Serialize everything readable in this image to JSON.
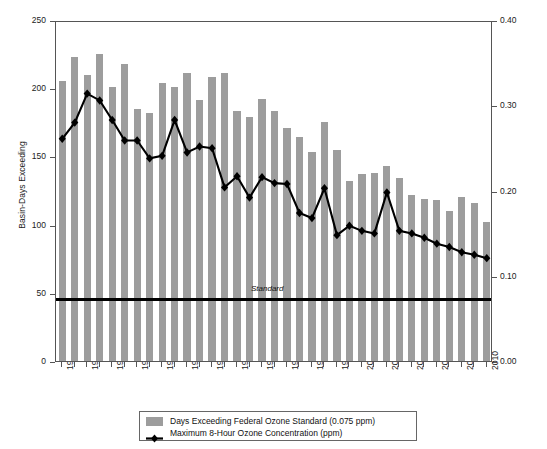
{
  "chart_data": {
    "type": "bar",
    "title": "",
    "xlabel": "",
    "ylabel": "Basin-Days Exceeding",
    "y2label": "Maximum Concentration, ppm",
    "ylim": [
      0,
      250
    ],
    "y2lim": [
      0.0,
      0.4
    ],
    "yticks": [
      0,
      50,
      100,
      150,
      200,
      250
    ],
    "ytick_labels": [
      "0",
      "50",
      "100",
      "150",
      "200",
      "250"
    ],
    "y2ticks": [
      0.0,
      0.1,
      0.2,
      0.3,
      0.4
    ],
    "y2tick_labels": [
      "0.00",
      "0.10",
      "0.20",
      "0.30",
      "0.40"
    ],
    "grid": false,
    "legend_position": "bottom-center",
    "x": [
      1976,
      1977,
      1978,
      1979,
      1980,
      1981,
      1982,
      1983,
      1984,
      1985,
      1986,
      1987,
      1988,
      1989,
      1990,
      1991,
      1992,
      1993,
      1994,
      1995,
      1996,
      1997,
      1998,
      1999,
      2000,
      2001,
      2002,
      2003,
      2004,
      2005,
      2006,
      2007,
      2008,
      2009,
      2010
    ],
    "xtick_labels": [
      "1976",
      "1978",
      "1980",
      "1982",
      "1984",
      "1986",
      "1988",
      "1990",
      "1992",
      "1994",
      "1996",
      "1998",
      "2000",
      "2002",
      "2004",
      "2006",
      "2008",
      "2010"
    ],
    "series": [
      {
        "name": "Days Exceeding Federal Ozone Standard (0.075 ppm)",
        "type": "bar",
        "axis": "left",
        "color": "#9d9d9d",
        "values": [
          205,
          223,
          210,
          225,
          201,
          218,
          185,
          182,
          204,
          201,
          211,
          191,
          208,
          211,
          183,
          179,
          192,
          183,
          171,
          164,
          153,
          175,
          155,
          132,
          137,
          138,
          143,
          134,
          122,
          119,
          118,
          110,
          120,
          116,
          102
        ]
      },
      {
        "name": "Maximum 8-Hour Ozone Concentration (ppm)",
        "type": "line",
        "axis": "right",
        "color": "#000000",
        "marker": "diamond",
        "values": [
          0.263,
          0.282,
          0.316,
          0.308,
          0.285,
          0.261,
          0.261,
          0.24,
          0.243,
          0.285,
          0.247,
          0.254,
          0.252,
          0.206,
          0.219,
          0.194,
          0.218,
          0.211,
          0.21,
          0.176,
          0.17,
          0.205,
          0.15,
          0.161,
          0.155,
          0.152,
          0.2,
          0.155,
          0.152,
          0.147,
          0.14,
          0.136,
          0.13,
          0.127,
          0.123
        ]
      }
    ],
    "annotations": [
      {
        "name": "standard-line",
        "label": "Standard",
        "value_ppm": 0.075,
        "style": "thick solid black horizontal line"
      }
    ]
  },
  "legend": {
    "items": [
      {
        "label": "Days Exceeding Federal Ozone Standard (0.075 ppm)",
        "swatch": "bar-swatch"
      },
      {
        "label": "Maximum 8-Hour Ozone Concentration (ppm)",
        "swatch": "line-marker-swatch"
      }
    ]
  }
}
